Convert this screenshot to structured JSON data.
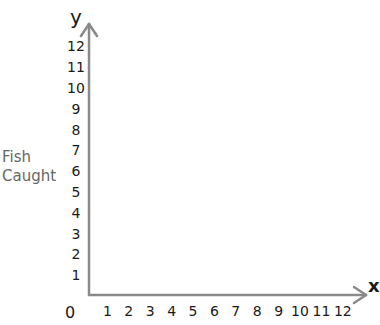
{
  "chart_data": {
    "type": "scatter",
    "title": "",
    "xlabel": "x",
    "ylabel": "y",
    "y_side_label": "Fish\nCaught",
    "origin_label": "0",
    "x_ticks": [
      1,
      2,
      3,
      4,
      5,
      6,
      7,
      8,
      9,
      10,
      11,
      12
    ],
    "y_ticks": [
      1,
      2,
      3,
      4,
      5,
      6,
      7,
      8,
      9,
      10,
      11,
      12
    ],
    "xlim": [
      0,
      12
    ],
    "ylim": [
      0,
      12
    ],
    "grid": false,
    "series": [],
    "note": "Empty coordinate axes with arrows; no data plotted"
  },
  "labels": {
    "y_axis_letter": "y",
    "x_axis_letter": "x",
    "side_label_line1": "Fish",
    "side_label_line2": "Caught",
    "origin": "0"
  },
  "colors": {
    "axis": "#8a8a8a",
    "tick_text": "#1a1a1a",
    "side_label": "#666666"
  }
}
